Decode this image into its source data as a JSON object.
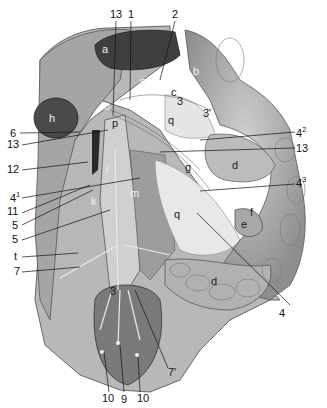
{
  "figure": {
    "type": "anatomical illustration",
    "numeric_labels": [
      {
        "id": "13_top",
        "text": "13"
      },
      {
        "id": "1",
        "text": "1"
      },
      {
        "id": "2",
        "text": "2"
      },
      {
        "id": "6",
        "text": "6"
      },
      {
        "id": "13_left",
        "text": "13"
      },
      {
        "id": "12",
        "text": "12"
      },
      {
        "id": "4_1",
        "text": "4",
        "sup": "1"
      },
      {
        "id": "11",
        "text": "11"
      },
      {
        "id": "5_a",
        "text": "5"
      },
      {
        "id": "5_b",
        "text": "5"
      },
      {
        "id": "t",
        "text": "t"
      },
      {
        "id": "7",
        "text": "7"
      },
      {
        "id": "4_2",
        "text": "4",
        "sup": "2"
      },
      {
        "id": "13_right",
        "text": "13"
      },
      {
        "id": "4_3",
        "text": "4",
        "sup": "3"
      },
      {
        "id": "4",
        "text": "4"
      },
      {
        "id": "7_prime",
        "text": "7'"
      },
      {
        "id": "10_left",
        "text": "10"
      },
      {
        "id": "9",
        "text": "9"
      },
      {
        "id": "10_right",
        "text": "10"
      }
    ],
    "letter_labels": [
      {
        "id": "a",
        "text": "a"
      },
      {
        "id": "b",
        "text": "b"
      },
      {
        "id": "c",
        "text": "c"
      },
      {
        "id": "3",
        "text": "3"
      },
      {
        "id": "3_prime",
        "text": "3'"
      },
      {
        "id": "q_top",
        "text": "q"
      },
      {
        "id": "n",
        "text": "n"
      },
      {
        "id": "o",
        "text": "o"
      },
      {
        "id": "p",
        "text": "p"
      },
      {
        "id": "h",
        "text": "h"
      },
      {
        "id": "g",
        "text": "g"
      },
      {
        "id": "d_top",
        "text": "d"
      },
      {
        "id": "i",
        "text": "i"
      },
      {
        "id": "m",
        "text": "m"
      },
      {
        "id": "k",
        "text": "k"
      },
      {
        "id": "q_mid",
        "text": "q"
      },
      {
        "id": "f",
        "text": "f"
      },
      {
        "id": "e",
        "text": "e"
      },
      {
        "id": "d_bottom",
        "text": "d"
      },
      {
        "id": "8",
        "text": "8"
      }
    ]
  }
}
